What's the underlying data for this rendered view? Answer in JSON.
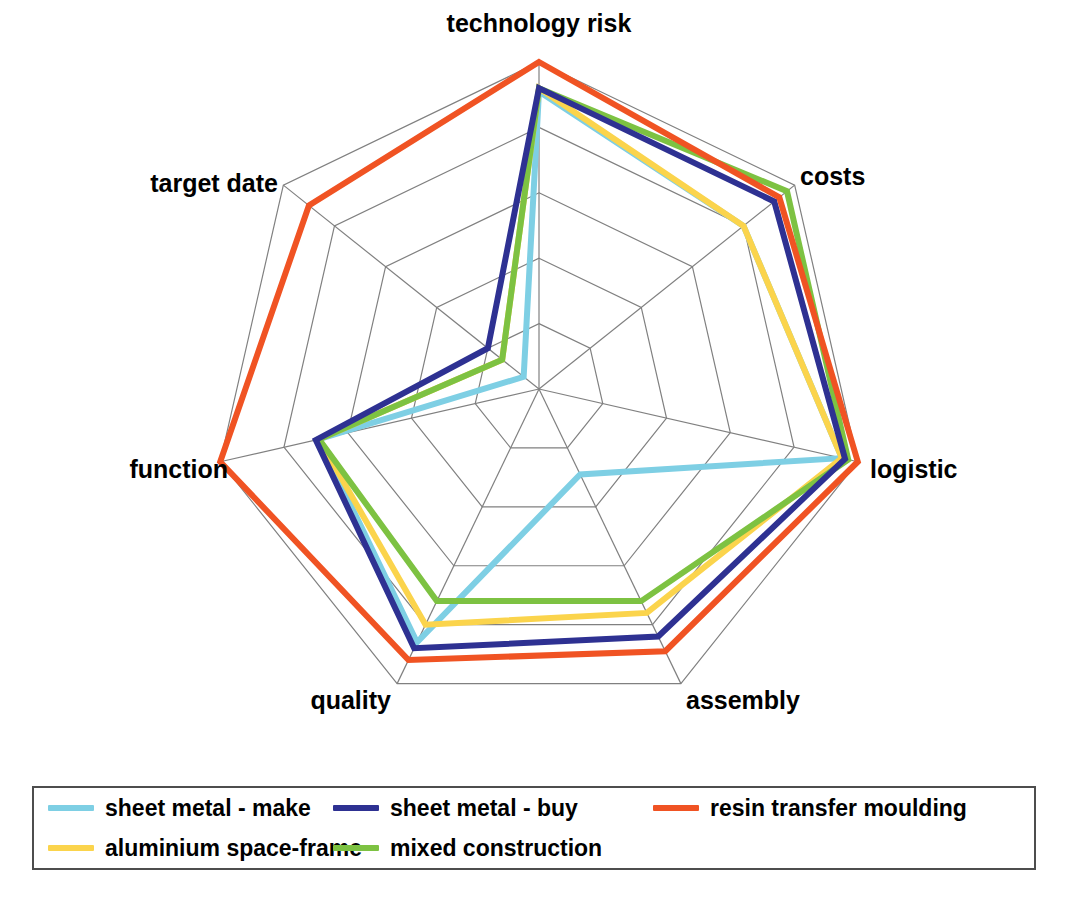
{
  "chart_data": {
    "type": "radar",
    "title": "",
    "categories": [
      "technology risk",
      "costs",
      "logistic",
      "assembly",
      "quality",
      "function",
      "target date"
    ],
    "rings": 5,
    "rmin": 0,
    "rmax": 5,
    "grid": true,
    "legend_position": "bottom",
    "series": [
      {
        "name": "sheet metal - make",
        "color": "#7ECFE4",
        "values": [
          4.55,
          4.0,
          4.75,
          1.45,
          4.3,
          3.45,
          0.3
        ]
      },
      {
        "name": "sheet metal - buy",
        "color": "#2E3192",
        "values": [
          4.6,
          4.6,
          4.8,
          4.2,
          4.4,
          3.5,
          1.0
        ]
      },
      {
        "name": "resin transfer moulding",
        "color": "#F05323",
        "values": [
          5.0,
          4.7,
          5.0,
          4.45,
          4.6,
          5.0,
          4.5
        ]
      },
      {
        "name": "aluminium space-frame",
        "color": "#FBD44C",
        "values": [
          4.6,
          4.0,
          4.75,
          3.8,
          4.0,
          3.45,
          0.72
        ]
      },
      {
        "name": "mixed construction",
        "color": "#7DC242",
        "values": [
          4.6,
          4.85,
          4.85,
          3.6,
          3.6,
          3.45,
          0.72
        ]
      }
    ],
    "geometry": {
      "center_x": 539,
      "center_y": 389,
      "outer_radius": 327,
      "grid_color": "#808080",
      "series_line_width": 6
    }
  },
  "axis_labels": [
    {
      "text": "technology risk",
      "x": 539,
      "y": 32,
      "anchor": "middle"
    },
    {
      "text": "costs",
      "x": 800,
      "y": 185,
      "anchor": "start"
    },
    {
      "text": "logistic",
      "x": 870,
      "y": 478,
      "anchor": "start"
    },
    {
      "text": "assembly",
      "x": 686,
      "y": 709,
      "anchor": "start"
    },
    {
      "text": "quality",
      "x": 391,
      "y": 709,
      "anchor": "end"
    },
    {
      "text": "function",
      "x": 228,
      "y": 478,
      "anchor": "end"
    },
    {
      "text": "target date",
      "x": 278,
      "y": 192,
      "anchor": "end"
    }
  ],
  "legend": {
    "rows": [
      [
        {
          "label": "sheet metal - make",
          "color": "#7ECFE4"
        },
        {
          "label": "sheet metal - buy",
          "color": "#2E3192"
        },
        {
          "label": "resin transfer moulding",
          "color": "#F05323"
        }
      ],
      [
        {
          "label": "aluminium space-frame",
          "color": "#FBD44C"
        },
        {
          "label": "mixed construction",
          "color": "#7DC242"
        }
      ]
    ]
  }
}
